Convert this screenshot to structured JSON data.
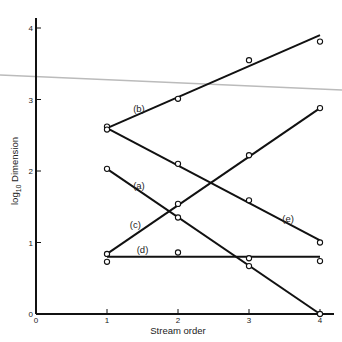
{
  "chart_data": {
    "type": "line",
    "title": "",
    "xlabel": "Stream order",
    "ylabel": "log10 Dimension",
    "ylabel_main": "log",
    "ylabel_sub": "10",
    "ylabel_rest": " Dimension",
    "xlim": [
      0,
      4
    ],
    "ylim": [
      0,
      4
    ],
    "x_ticks": [
      0,
      1,
      2,
      3,
      4
    ],
    "y_ticks": [
      0,
      1,
      2,
      3,
      4
    ],
    "x_tick_labels": [
      "0",
      "1",
      "2",
      "3",
      "4"
    ],
    "y_tick_labels": [
      "0",
      "1",
      "2",
      "3",
      "4"
    ],
    "grid": false,
    "legend": "inline labels",
    "series": [
      {
        "name": "(a)",
        "points": [
          [
            1,
            2.03
          ],
          [
            2,
            1.35
          ],
          [
            3,
            0.67
          ],
          [
            4,
            0.0
          ]
        ],
        "fit": [
          [
            1,
            2.03
          ],
          [
            4,
            0.0
          ]
        ],
        "label_pos": [
          1.45,
          1.75
        ]
      },
      {
        "name": "(b)",
        "points": [
          [
            1,
            2.62
          ],
          [
            2,
            3.01
          ],
          [
            3,
            3.55
          ],
          [
            4,
            3.81
          ]
        ],
        "fit": [
          [
            1,
            2.6
          ],
          [
            4,
            3.9
          ]
        ],
        "label_pos": [
          1.45,
          2.82
        ]
      },
      {
        "name": "(c)",
        "points": [
          [
            1,
            0.84
          ],
          [
            2,
            1.54
          ],
          [
            3,
            2.22
          ],
          [
            4,
            2.88
          ]
        ],
        "fit": [
          [
            1,
            0.84
          ],
          [
            4,
            2.88
          ]
        ],
        "label_pos": [
          1.4,
          1.2
        ]
      },
      {
        "name": "(d)",
        "points": [
          [
            1,
            0.73
          ],
          [
            2,
            0.86
          ],
          [
            3,
            0.78
          ],
          [
            4,
            0.74
          ]
        ],
        "fit": [
          [
            1,
            0.8
          ],
          [
            4,
            0.8
          ]
        ],
        "label_pos": [
          1.5,
          0.86
        ]
      },
      {
        "name": "(e)",
        "points": [
          [
            1,
            2.58
          ],
          [
            2,
            2.1
          ],
          [
            3,
            1.59
          ],
          [
            4,
            1.0
          ]
        ],
        "fit": [
          [
            1,
            2.6
          ],
          [
            4,
            1.03
          ]
        ],
        "label_pos": [
          3.55,
          1.28
        ]
      }
    ],
    "annotations": [
      "(a)",
      "(b)",
      "(c)",
      "(d)",
      "(e)"
    ]
  },
  "overlay_line": {
    "color": "#bbbbbb",
    "from": [
      0,
      75
    ],
    "to": [
      342,
      90
    ]
  },
  "colors": {
    "line": "#111111",
    "axis": "#111111",
    "marker_fill": "#ffffff"
  }
}
